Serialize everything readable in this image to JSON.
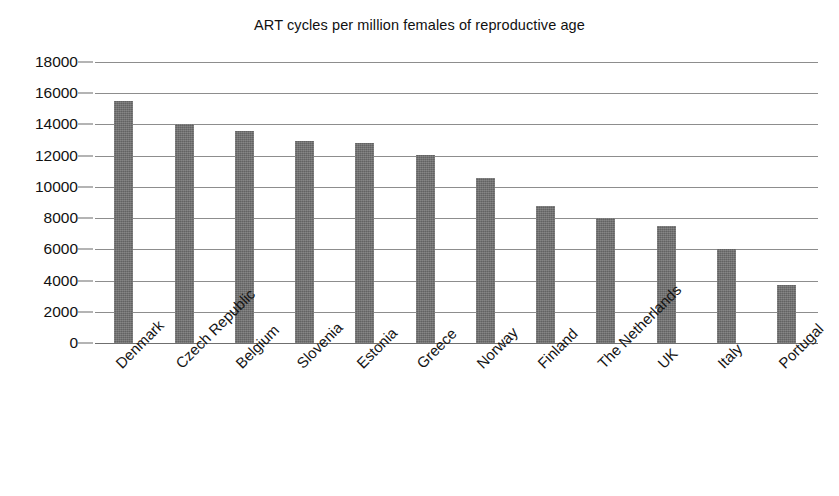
{
  "chart_data": {
    "type": "bar",
    "title": "ART cycles per million females of reproductive age",
    "xlabel": "",
    "ylabel": "",
    "ylim": [
      0,
      18000
    ],
    "ytick_labels": [
      "18000",
      "16000",
      "14000",
      "12000",
      "10000",
      "8000",
      "6000",
      "4000",
      "2000",
      "0"
    ],
    "ytick_values": [
      18000,
      16000,
      14000,
      12000,
      10000,
      8000,
      6000,
      4000,
      2000,
      0
    ],
    "grid": true,
    "legend": "none",
    "bar_color": "#6e6e6e",
    "categories": [
      "Denmark",
      "Czech Republic",
      "Belgium",
      "Slovenia",
      "Estonia",
      "Greece",
      "Norway",
      "Finland",
      "The Netherlands",
      "UK",
      "Italy",
      "Portugal"
    ],
    "values": [
      15500,
      14000,
      13600,
      12950,
      12800,
      12050,
      10550,
      8750,
      8000,
      7500,
      6050,
      3700
    ]
  }
}
